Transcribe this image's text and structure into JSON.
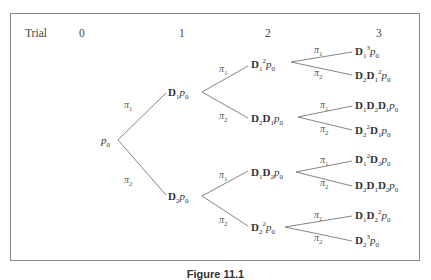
{
  "figure": {
    "header": {
      "label": "Trial",
      "trials": [
        "0",
        "1",
        "2",
        "3"
      ]
    },
    "root": {
      "prefix": "",
      "text": "p",
      "sub": "0"
    },
    "branch_labels": {
      "pi1": "π",
      "pi1_sub": "1",
      "pi2": "π",
      "pi2_sub": "2"
    },
    "level1": [
      {
        "html": "D<sub>1</sub><i>p</i><sub>0</sub>",
        "text": "D1 p0"
      },
      {
        "html": "D<sub>2</sub><i>p</i><sub>0</sub>",
        "text": "D2 p0"
      }
    ],
    "level2": [
      {
        "text": "D1^2 p0"
      },
      {
        "text": "D2 D1 p0"
      },
      {
        "text": "D1 D2 p0"
      },
      {
        "text": "D2^2 p0"
      }
    ],
    "level3": [
      {
        "text": "D1^3 p0"
      },
      {
        "text": "D2 D1^2 p0"
      },
      {
        "text": "D1 D2 D1 p0"
      },
      {
        "text": "D2^2 D1 p0"
      },
      {
        "text": "D1^2 D2 p0"
      },
      {
        "text": "D2 D1 D2 p0"
      },
      {
        "text": "D1 D2^2 p0"
      },
      {
        "text": "D2^3 p0"
      }
    ],
    "caption": "Figure 11.1"
  }
}
